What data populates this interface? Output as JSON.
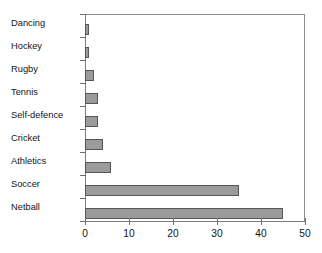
{
  "caption": {
    "clipped_text": ""
  },
  "chart_data": {
    "type": "bar",
    "orientation": "horizontal",
    "title": "",
    "subtitle": "",
    "xlabel": "",
    "ylabel": "",
    "categories": [
      "Dancing",
      "Hockey",
      "Rugby",
      "Tennis",
      "Self-defence",
      "Cricket",
      "Athletics",
      "Soccer",
      "Netball"
    ],
    "values": [
      1,
      1,
      2,
      3,
      3,
      4,
      6,
      35,
      45
    ],
    "xlim": [
      0,
      50
    ],
    "xticks": [
      0,
      10,
      20,
      30,
      40,
      50
    ],
    "xtick_labels": [
      "0",
      "10",
      "20",
      "30",
      "40",
      "50"
    ],
    "grid": false,
    "legend": false,
    "legend_position": "none",
    "bar_fill_color": "#9b9b9b",
    "bar_edge_color": "#55555a",
    "axis_color": "#7a7a7a",
    "background_color": "#ffffff"
  }
}
